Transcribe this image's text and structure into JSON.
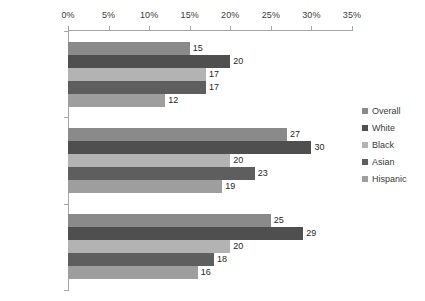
{
  "chart_data": {
    "type": "bar",
    "orientation": "horizontal",
    "title": "",
    "subtitle": "",
    "xlabel": "",
    "ylabel": "",
    "xlim": [
      0,
      35
    ],
    "xtick_labels": [
      "0%",
      "5%",
      "10%",
      "15%",
      "20%",
      "25%",
      "30%",
      "35%"
    ],
    "xtick_values": [
      0,
      5,
      10,
      15,
      20,
      25,
      30,
      35
    ],
    "grid": false,
    "legend_position": "right",
    "categories": [
      "Foreign-Born",
      "Native-Born",
      "Total"
    ],
    "series": [
      {
        "name": "Overall",
        "color": "#8a8a8a",
        "values": [
          15,
          27,
          25
        ]
      },
      {
        "name": "White",
        "color": "#4f4f4f",
        "values": [
          20,
          30,
          29
        ]
      },
      {
        "name": "Black",
        "color": "#b3b3b3",
        "values": [
          17,
          20,
          20
        ]
      },
      {
        "name": "Asian",
        "color": "#5e5e5e",
        "values": [
          17,
          23,
          18
        ]
      },
      {
        "name": "Hispanic",
        "color": "#9e9e9e",
        "values": [
          12,
          19,
          16
        ]
      }
    ],
    "data_labels": {
      "Foreign-Born": [
        "15",
        "20",
        "17",
        "17",
        "12"
      ],
      "Native-Born": [
        "27",
        "30",
        "20",
        "23",
        "19"
      ],
      "Total": [
        "25",
        "29",
        "20",
        "18",
        "16"
      ]
    }
  },
  "axis": {
    "axis_color": "#a6a6a6"
  },
  "legend": {
    "items": [
      {
        "label": "Overall"
      },
      {
        "label": "White"
      },
      {
        "label": "Black"
      },
      {
        "label": "Asian"
      },
      {
        "label": "Hispanic"
      }
    ]
  }
}
